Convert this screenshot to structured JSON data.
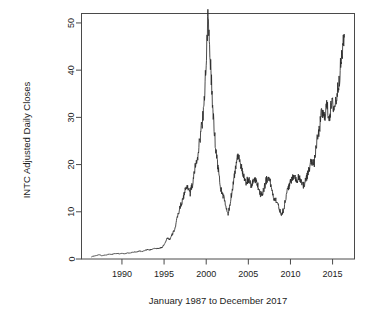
{
  "chart_data": {
    "type": "line",
    "title": "",
    "xlabel": "January 1987 to December 2017",
    "ylabel": "INTC Adjusted Daily Closes",
    "xlim": [
      1986.0,
      1987.0
    ],
    "ylim": [
      0,
      52
    ],
    "xticks": [
      1990,
      1995,
      2000,
      2005,
      2010,
      2015
    ],
    "xtick_labels": [
      "1990",
      "1995",
      "2000",
      "2005",
      "2010",
      "2015"
    ],
    "yticks": [
      0,
      10,
      20,
      30,
      40,
      50
    ],
    "ytick_labels": [
      "0",
      "10",
      "20",
      "30",
      "40",
      "50"
    ],
    "grid": false,
    "legend": "none",
    "series": [
      {
        "name": "INTC Adjusted Daily Closes",
        "color": "#2a2a2a",
        "x": [
          1986.4,
          1986.7,
          1987.0,
          1987.3,
          1987.6,
          1987.9,
          1988.2,
          1988.5,
          1988.8,
          1989.1,
          1989.4,
          1989.7,
          1990.0,
          1990.3,
          1990.6,
          1990.9,
          1991.2,
          1991.5,
          1991.8,
          1992.1,
          1992.4,
          1992.7,
          1993.0,
          1993.3,
          1993.6,
          1993.9,
          1994.2,
          1994.5,
          1994.8,
          1995.1,
          1995.4,
          1995.7,
          1996.0,
          1996.3,
          1996.6,
          1996.9,
          1997.2,
          1997.5,
          1997.8,
          1998.1,
          1998.4,
          1998.7,
          1999.0,
          1999.3,
          1999.6,
          1999.9,
          2000.2,
          2000.5,
          2000.8,
          2001.1,
          2001.4,
          2001.7,
          2002.0,
          2002.3,
          2002.6,
          2002.9,
          2003.2,
          2003.5,
          2003.8,
          2004.1,
          2004.4,
          2004.7,
          2005.0,
          2005.3,
          2005.6,
          2005.9,
          2006.2,
          2006.5,
          2006.8,
          2007.1,
          2007.4,
          2007.7,
          2008.0,
          2008.3,
          2008.6,
          2008.9,
          2009.2,
          2009.5,
          2009.8,
          2010.1,
          2010.4,
          2010.7,
          2011.0,
          2011.3,
          2011.6,
          2011.9,
          2012.2,
          2012.5,
          2012.8,
          2013.1,
          2013.4,
          2013.7,
          2014.0,
          2014.3,
          2014.6,
          2014.9,
          2015.2,
          2015.5,
          2015.8,
          2016.1,
          2016.4
        ],
        "y": [
          0.5,
          0.6,
          0.8,
          0.9,
          0.7,
          0.8,
          0.9,
          1.0,
          1.0,
          1.1,
          1.2,
          1.1,
          1.2,
          1.1,
          1.3,
          1.2,
          1.4,
          1.5,
          1.5,
          1.7,
          1.6,
          1.8,
          2.0,
          1.9,
          2.1,
          2.2,
          2.2,
          2.3,
          2.5,
          3.4,
          4.5,
          4.1,
          5.3,
          6.5,
          9.0,
          11.0,
          12.5,
          14.5,
          15.5,
          14.0,
          16.0,
          19.5,
          22.0,
          26.0,
          30.0,
          38.0,
          50.5,
          42.0,
          31.0,
          24.0,
          19.5,
          15.0,
          13.5,
          11.5,
          9.2,
          12.5,
          16.0,
          19.5,
          22.5,
          20.0,
          17.5,
          16.0,
          17.0,
          15.5,
          16.5,
          17.0,
          15.0,
          13.5,
          14.5,
          16.5,
          17.5,
          15.5,
          13.0,
          12.5,
          11.0,
          9.5,
          10.5,
          13.5,
          15.5,
          16.5,
          18.0,
          16.5,
          17.5,
          16.5,
          15.5,
          17.0,
          19.0,
          21.0,
          20.0,
          24.5,
          27.0,
          31.0,
          30.0,
          32.5,
          30.0,
          33.0,
          32.0,
          34.5,
          38.5,
          43.0,
          47.0
        ]
      }
    ],
    "annotations": []
  },
  "axes": {
    "ylabel": "INTC Adjusted Daily Closes",
    "xlabel": "January 1987 to December 2017"
  }
}
